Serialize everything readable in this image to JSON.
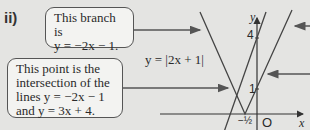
{
  "part_label": "ii)",
  "annotations": {
    "branch": {
      "line1": "This branch is",
      "line2": "y = −2x − 1."
    },
    "intersection": {
      "line1": "This point is the",
      "line2": "intersection of the",
      "line3": "lines y = −2x − 1",
      "line4": "and y = 3x + 4."
    }
  },
  "graph": {
    "equation_label": "y = |2x + 1|",
    "y_axis_label": "y",
    "x_axis_label": "x",
    "origin_label": "O",
    "y_tick_4": "4",
    "y_tick_1": "1",
    "x_tick_neg_half": "−½"
  },
  "colors": {
    "background": "#e4e4e2",
    "box_fill": "#f3f3f1",
    "stroke": "#555555"
  }
}
